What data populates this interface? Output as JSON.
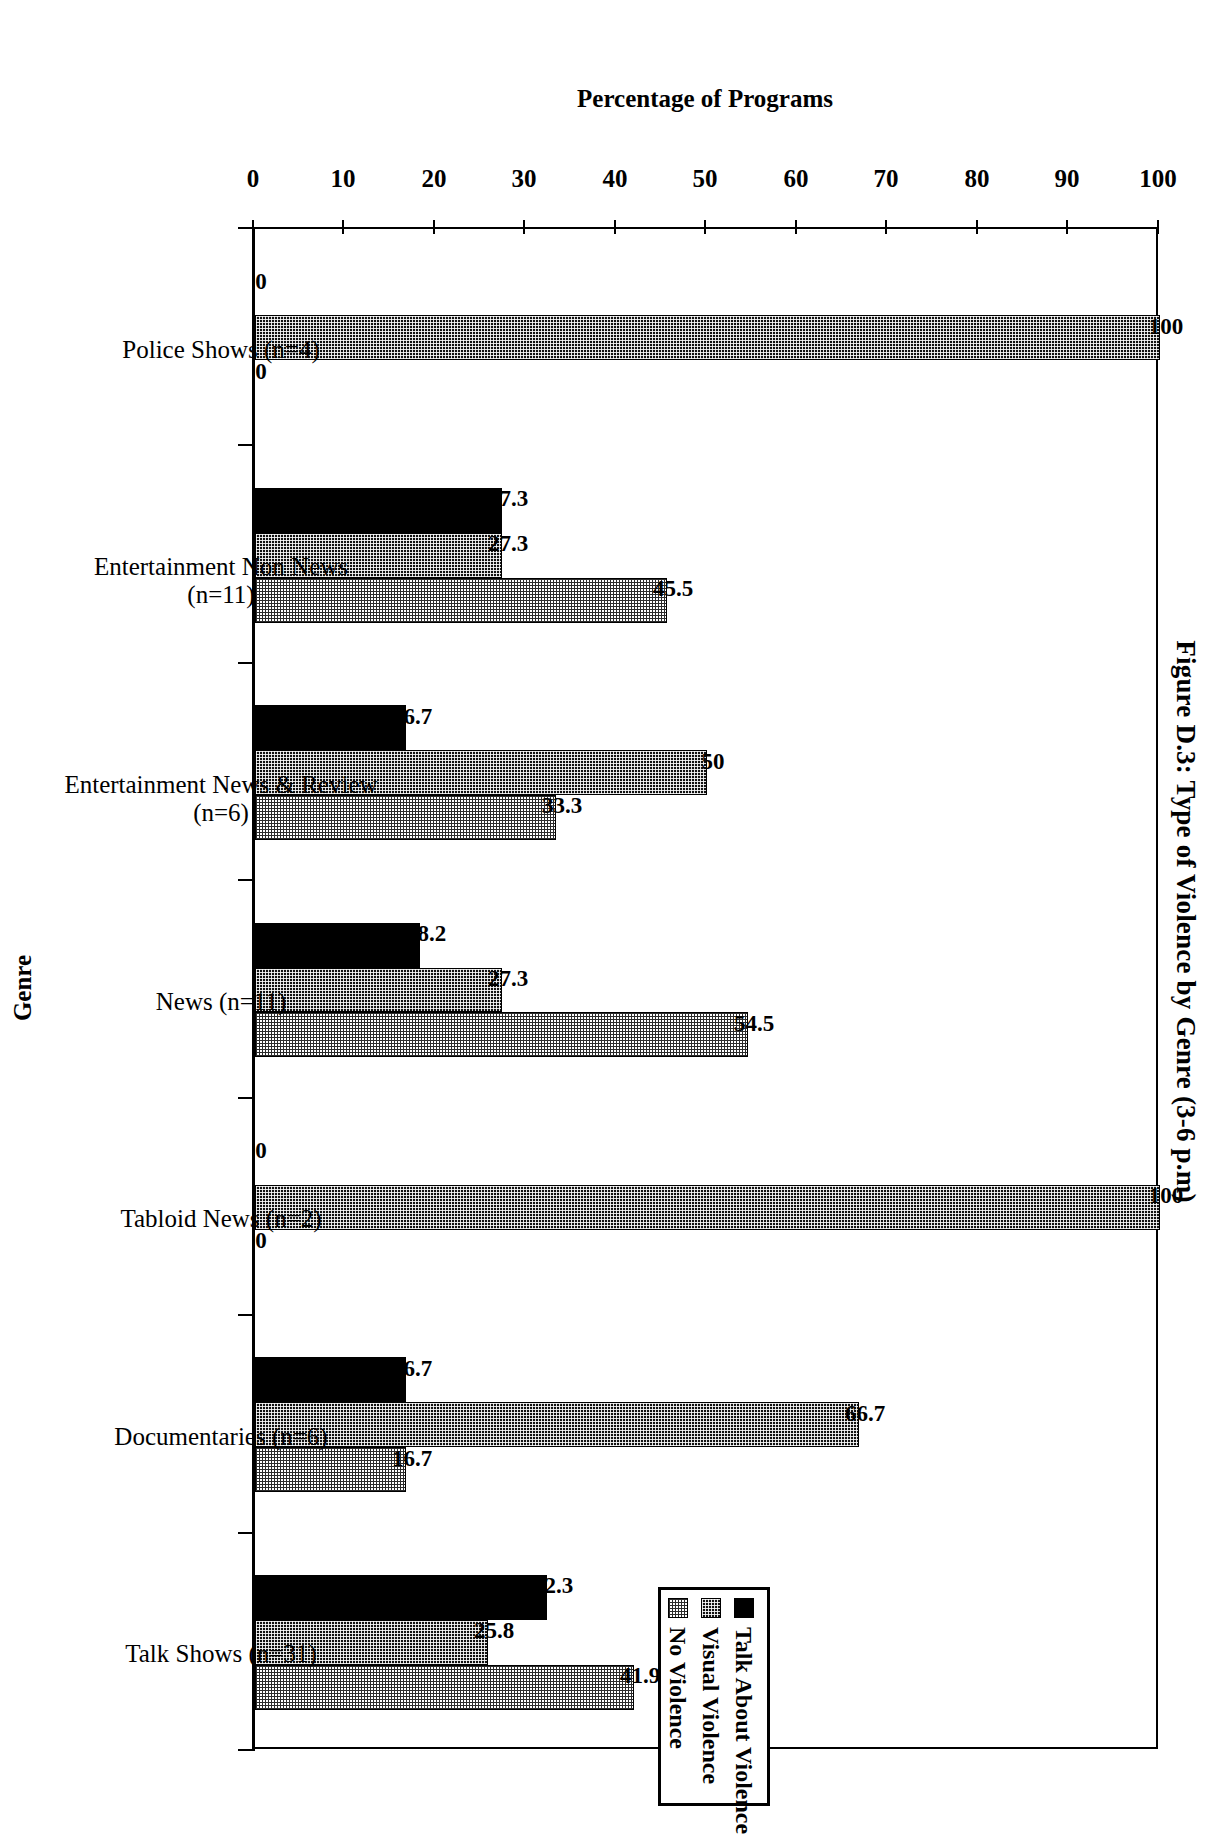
{
  "title": "Figure D.3: Type of Violence by Genre (3-6 p.m)",
  "axes": {
    "value_axis_title": "Percentage of Programs",
    "category_axis_title": "Genre"
  },
  "legend": {
    "items": [
      {
        "label": "Talk About Violence",
        "swatch": "solid-black-swatch"
      },
      {
        "label": "Visual Violence",
        "swatch": "dark-dotted-swatch"
      },
      {
        "label": "No Violence",
        "swatch": "light-dotted-swatch"
      }
    ]
  },
  "chart_data": {
    "type": "bar",
    "title": "Figure D.3: Type of Violence by Genre (3-6 p.m)",
    "xlabel": "Genre",
    "ylabel": "Percentage of Programs",
    "ylim": [
      0,
      100
    ],
    "yticks": [
      0,
      10,
      20,
      30,
      40,
      50,
      60,
      70,
      80,
      90,
      100
    ],
    "grid": false,
    "orientation": "vertical-rotated-90cw",
    "legend_position": "top-right",
    "categories": [
      "Police Shows (n=4)",
      "Entertainment Non News (n=11)",
      "Entertainment News & Review (n=6)",
      "News (n=11)",
      "Tabloid News (n=2)",
      "Documentaries (n=6)",
      "Talk Shows (n=31)"
    ],
    "category_lines": [
      [
        "Police Shows (n=4)",
        ""
      ],
      [
        "Entertainment Non News",
        "(n=11)"
      ],
      [
        "Entertainment News & Review",
        "(n=6)"
      ],
      [
        "News (n=11)",
        ""
      ],
      [
        "Tabloid News (n=2)",
        ""
      ],
      [
        "Documentaries (n=6)",
        ""
      ],
      [
        "Talk Shows (n=31)",
        ""
      ]
    ],
    "series": [
      {
        "name": "Talk About Violence",
        "values": [
          0,
          27.3,
          16.7,
          18.2,
          0,
          16.7,
          32.3
        ]
      },
      {
        "name": "Visual Violence",
        "values": [
          100,
          27.3,
          50,
          27.3,
          100,
          66.7,
          25.8
        ]
      },
      {
        "name": "No Violence",
        "values": [
          0,
          45.5,
          33.3,
          54.5,
          0,
          16.7,
          41.9
        ]
      }
    ],
    "value_labels": [
      [
        "0",
        "100",
        "0"
      ],
      [
        "27.3",
        "27.3",
        "45.5"
      ],
      [
        "16.7",
        "50",
        "33.3"
      ],
      [
        "18.2",
        "27.3",
        "54.5"
      ],
      [
        "0",
        "100",
        "0"
      ],
      [
        "16.7",
        "66.7",
        "16.7"
      ],
      [
        "32.3",
        "25.8",
        "41.9"
      ]
    ]
  }
}
